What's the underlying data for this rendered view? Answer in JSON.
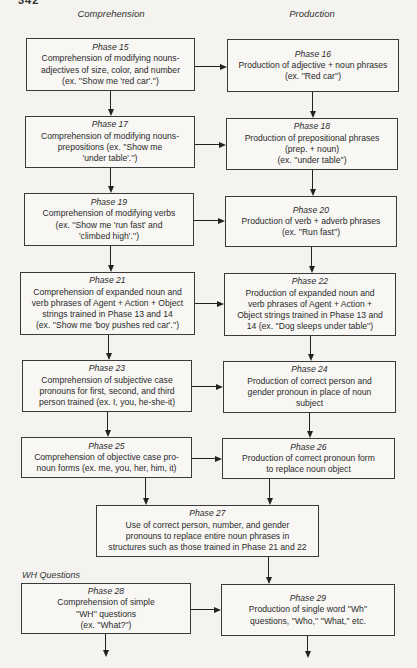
{
  "page": {
    "number": "342"
  },
  "columns": {
    "left": "Comprehension",
    "right": "Production"
  },
  "section": {
    "wh_questions": "WH Questions"
  },
  "phases": {
    "p15": {
      "label": "Phase 15",
      "desc": "Comprehension of modifying nouns-\nadjectives of size, color, and number\n(ex. ''Show me 'red car'.'')"
    },
    "p16": {
      "label": "Phase 16",
      "desc": "Production of adjective + noun phrases\n(ex. ''Red car'')"
    },
    "p17": {
      "label": "Phase 17",
      "desc": "Comprehension of modifying nouns-\nprepositions (ex. ''Show me\n'under table'.'')"
    },
    "p18": {
      "label": "Phase 18",
      "desc": "Production of prepositional phrases\n(prep. + noun)\n(ex. ''under table'')"
    },
    "p19": {
      "label": "Phase 19",
      "desc": "Comprehension of modifying verbs\n(ex. ''Show me 'run fast' and\n'climbed high'.'')"
    },
    "p20": {
      "label": "Phase 20",
      "desc": "Production of verb + adverb phrases\n(ex. ''Run fast'')"
    },
    "p21": {
      "label": "Phase 21",
      "desc": "Comprehension of expanded noun and\nverb phrases of Agent + Action + Object\nstrings trained in Phase 13 and 14\n(ex. ''Show me 'boy pushes red car'.'')"
    },
    "p22": {
      "label": "Phase 22",
      "desc": "Production of expanded noun and\nverb phrases of Agent + Action +\nObject strings trained in Phase 13 and\n14 (ex. ''Dog sleeps under table'')"
    },
    "p23": {
      "label": "Phase 23",
      "desc": "Comprehension of subjective case\npronouns for first, second, and third\nperson trained (ex. I, you, he-she-it)"
    },
    "p24": {
      "label": "Phase 24",
      "desc": "Production of correct person and\ngender pronoun in place of noun\nsubject"
    },
    "p25": {
      "label": "Phase 25",
      "desc": "Comprehension of objective case pro-\nnoun forms (ex. me, you, her, him, it)"
    },
    "p26": {
      "label": "Phase 26",
      "desc": "Production of correct pronoun form\nto replace noun object"
    },
    "p27": {
      "label": "Phase 27",
      "desc": "Use of correct person, number, and gender\npronouns to replace entire noun phrases in\nstructures such as those trained in Phase 21 and 22"
    },
    "p28": {
      "label": "Phase 28",
      "desc": "Comprehension of simple\n''WH'' questions\n(ex. ''What?'')"
    },
    "p29": {
      "label": "Phase 29",
      "desc": "Production of single word ''Wh''\nquestions, ''Who,'' ''What,'' etc."
    }
  }
}
